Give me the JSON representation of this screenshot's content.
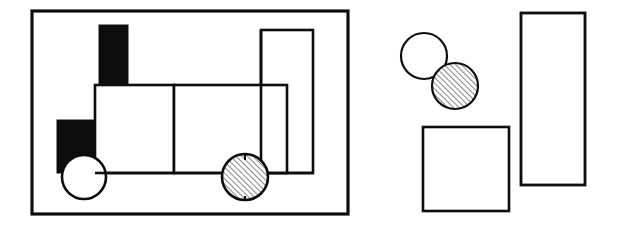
{
  "figure": {
    "title": "Hand-drawn line figure: composite train of geometric shapes and separated component shapes",
    "background_color": "#ffffff",
    "ink_color": "#0d0d0d",
    "width": 617,
    "height": 237,
    "panels": [
      {
        "id": "left-panel",
        "name": "framed-composite-object",
        "description": "Rectangular frame enclosing a train-like object built from rectangles and circles"
      },
      {
        "id": "right-panel",
        "name": "scattered-component-shapes",
        "description": "Loose arrangement of a white circle, a hatched circle, a square and a tall rectangle"
      }
    ]
  },
  "chart_data": {
    "type": "diagram",
    "stroke_color": "#0d0d0d",
    "fill_black": "#101010",
    "fill_white": "#ffffff",
    "hatch_angle_deg": 45,
    "hatch_spacing_px": 4,
    "shapes": [
      {
        "id": "outer-frame",
        "panel": "left-panel",
        "kind": "rect",
        "label": "outer frame",
        "fill": "none",
        "stroke_width": 3.2,
        "x": 32,
        "y": 11,
        "width": 316,
        "height": 203
      },
      {
        "id": "chimney-black-rect",
        "panel": "left-panel",
        "kind": "rect",
        "label": "black chimney rectangle",
        "fill": "black",
        "stroke_width": 0,
        "x": 99,
        "y": 25,
        "width": 29,
        "height": 61
      },
      {
        "id": "cab-black-rect",
        "panel": "left-panel",
        "kind": "rect",
        "label": "black lower-left rectangle",
        "fill": "black",
        "stroke_width": 0,
        "x": 57,
        "y": 120,
        "width": 42,
        "height": 53
      },
      {
        "id": "body-left-rect",
        "panel": "left-panel",
        "kind": "rect",
        "label": "body left rectangle",
        "fill": "white",
        "stroke_width": 2.6,
        "x": 95,
        "y": 85,
        "width": 79,
        "height": 88
      },
      {
        "id": "body-right-rect",
        "panel": "left-panel",
        "kind": "rect",
        "label": "body right rectangle",
        "fill": "white",
        "stroke_width": 2.6,
        "x": 174,
        "y": 85,
        "width": 113,
        "height": 88
      },
      {
        "id": "tall-right-rect",
        "panel": "left-panel",
        "kind": "rect",
        "label": "tall upright rectangle",
        "fill": "white",
        "stroke_width": 2.6,
        "x": 261,
        "y": 30,
        "width": 52,
        "height": 143
      },
      {
        "id": "front-white-circle",
        "panel": "left-panel",
        "kind": "circle",
        "label": "white wheel circle",
        "fill": "white",
        "stroke_width": 2.6,
        "cx": 84,
        "cy": 177,
        "r": 22
      },
      {
        "id": "rear-hatched-circle",
        "panel": "left-panel",
        "kind": "circle",
        "label": "hatched wheel circle",
        "fill": "hatch",
        "stroke_width": 2.6,
        "cx": 245,
        "cy": 177,
        "r": 23
      },
      {
        "id": "loose-white-circle",
        "panel": "right-panel",
        "kind": "circle",
        "label": "detached white circle",
        "fill": "white",
        "stroke_width": 2.2,
        "cx": 424,
        "cy": 56,
        "r": 23
      },
      {
        "id": "loose-hatched-circle",
        "panel": "right-panel",
        "kind": "circle",
        "label": "detached hatched circle",
        "fill": "hatch",
        "stroke_width": 2.2,
        "cx": 455,
        "cy": 86,
        "r": 23
      },
      {
        "id": "loose-square",
        "panel": "right-panel",
        "kind": "rect",
        "label": "detached square",
        "fill": "white",
        "stroke_width": 2.6,
        "x": 423,
        "y": 127,
        "width": 86,
        "height": 84
      },
      {
        "id": "loose-tall-rect",
        "panel": "right-panel",
        "kind": "rect",
        "label": "detached tall rectangle",
        "fill": "white",
        "stroke_width": 2.8,
        "x": 521,
        "y": 13,
        "width": 64,
        "height": 172
      }
    ]
  }
}
